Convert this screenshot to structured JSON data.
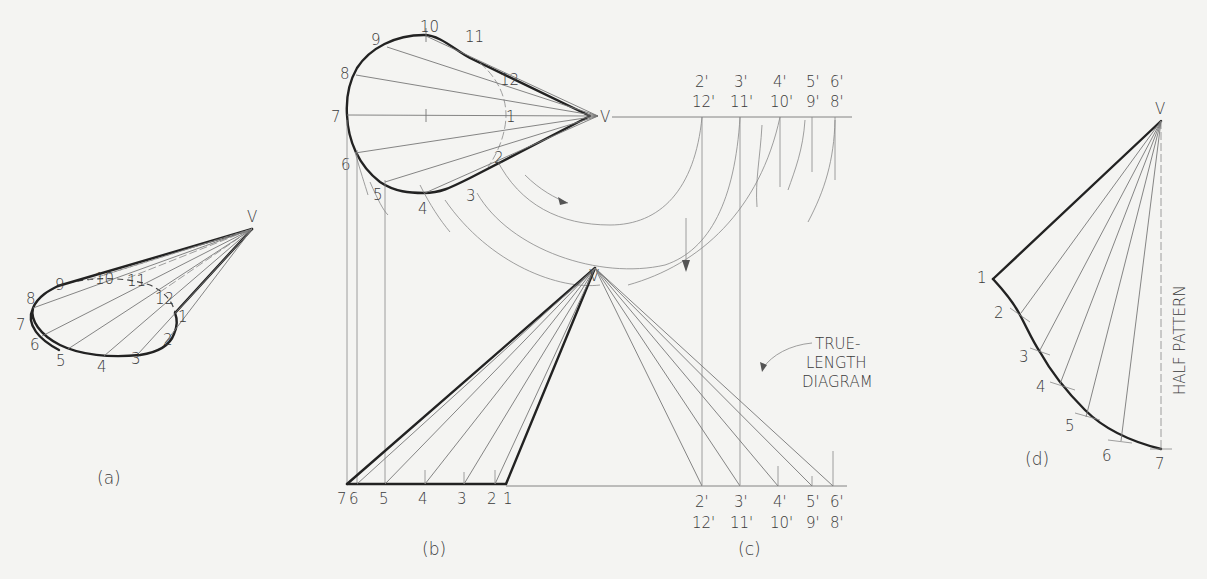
{
  "figure": {
    "panels": [
      {
        "id": "a",
        "caption": "(a)"
      },
      {
        "id": "b",
        "caption": "(b)"
      },
      {
        "id": "c",
        "caption": "(c)"
      },
      {
        "id": "d",
        "caption": "(d)"
      }
    ],
    "vertex_label": "V",
    "panel_a": {
      "points": [
        "1",
        "2",
        "3",
        "4",
        "5",
        "6",
        "7",
        "8",
        "9",
        "10",
        "11",
        "12"
      ]
    },
    "panel_b_top": {
      "points": [
        "1",
        "2",
        "3",
        "4",
        "5",
        "6",
        "7",
        "8",
        "9",
        "10",
        "11",
        "12"
      ]
    },
    "panel_b_front": {
      "baseline_labels": [
        "7",
        "6",
        "5",
        "4",
        "3",
        "2",
        "1"
      ]
    },
    "panel_c": {
      "top_labels_upper": [
        "2'",
        "3'",
        "4'",
        "5'",
        "6'"
      ],
      "top_labels_lower": [
        "12'",
        "11'",
        "10'",
        "9'",
        "8'"
      ],
      "bottom_labels_upper": [
        "2'",
        "3'",
        "4'",
        "5'",
        "6'"
      ],
      "bottom_labels_lower": [
        "12'",
        "11'",
        "10'",
        "9'",
        "8'"
      ],
      "annotation_line1": "TRUE-",
      "annotation_line2": "LENGTH",
      "annotation_line3": "DIAGRAM"
    },
    "panel_d": {
      "points": [
        "1",
        "2",
        "3",
        "4",
        "5",
        "6",
        "7"
      ],
      "side_label": "HALF PATTERN"
    }
  }
}
